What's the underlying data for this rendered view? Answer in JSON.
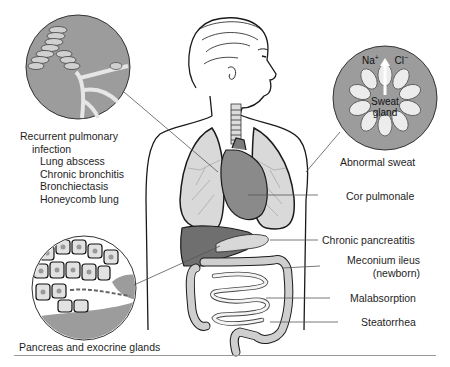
{
  "insets": {
    "lung": {
      "name": "bronchi-inset"
    },
    "sweat": {
      "ions": [
        "Na+",
        "Cl−"
      ],
      "na": "Na",
      "na_sup": "+",
      "cl": "Cl",
      "cl_sup": "−",
      "gland_line1": "Sweat",
      "gland_line2": "gland"
    },
    "pancreas": {
      "name": "pancreas-inset"
    }
  },
  "labels": {
    "pulmonary": {
      "heading_line1": "Recurrent pulmonary",
      "heading_line2": "infection",
      "items": [
        "Lung abscess",
        "Chronic bronchitis",
        "Bronchiectasis",
        "Honeycomb lung"
      ]
    },
    "pancreas_glands": "Pancreas and exocrine glands",
    "abnormal_sweat": "Abnormal sweat",
    "cor_pulmonale": "Cor pulmonale",
    "chronic_pancreatitis": "Chronic pancreatitis",
    "meconium_line1": "Meconium ileus",
    "meconium_line2": "(newborn)",
    "malabsorption": "Malabsorption",
    "steatorrhea": "Steatorrhea"
  },
  "colors": {
    "inset_gray": "#9c9c9c",
    "lung_fill": "#d9d9d9",
    "heart_fill": "#8a8a8a",
    "liver_fill": "#6f6f6f",
    "intestine_fill": "#cfcfcf",
    "leader_line": "#555555",
    "rule": "#9a9a9a"
  }
}
